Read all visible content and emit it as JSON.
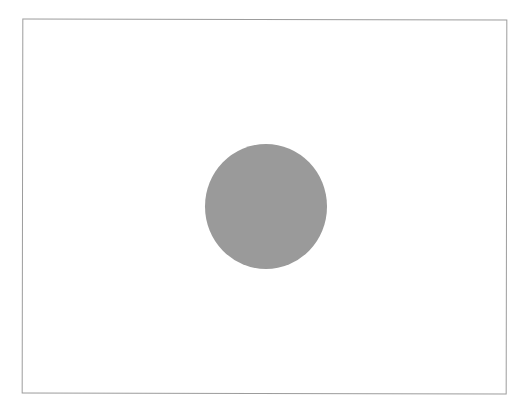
{
  "figure": {
    "frame": {
      "shape": "rectangle",
      "border_color": "#9c9c9c",
      "fill_color": "#ffffff"
    },
    "shapes": [
      {
        "shape": "circle",
        "fill_color": "#9a9a9a"
      }
    ]
  }
}
